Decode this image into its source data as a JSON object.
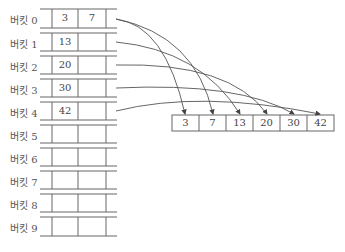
{
  "diagram": {
    "caption_partial": "",
    "buckets": [
      {
        "label": "버킷 0",
        "values": [
          "3",
          "7"
        ]
      },
      {
        "label": "버킷 1",
        "values": [
          "13",
          ""
        ]
      },
      {
        "label": "버킷 2",
        "values": [
          "20",
          ""
        ]
      },
      {
        "label": "버킷 3",
        "values": [
          "30",
          ""
        ]
      },
      {
        "label": "버킷 4",
        "values": [
          "42",
          ""
        ]
      },
      {
        "label": "버킷 5",
        "values": [
          "",
          ""
        ]
      },
      {
        "label": "버킷 6",
        "values": [
          "",
          ""
        ]
      },
      {
        "label": "버킷 7",
        "values": [
          "",
          ""
        ]
      },
      {
        "label": "버킷 8",
        "values": [
          "",
          ""
        ]
      },
      {
        "label": "버킷 9",
        "values": [
          "",
          ""
        ]
      }
    ],
    "result_array": [
      "3",
      "7",
      "13",
      "20",
      "30",
      "42"
    ],
    "colors": {
      "line": "#555555",
      "text": "#444444",
      "label": "#555555"
    }
  }
}
